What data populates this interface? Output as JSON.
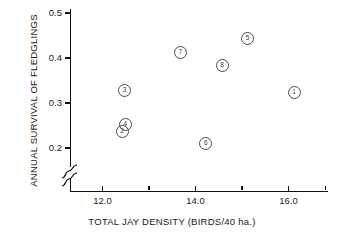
{
  "chart_data": {
    "type": "scatter",
    "title": "",
    "xlabel": "TOTAL JAY DENSITY (BIRDS/40 ha.)",
    "ylabel": "ANNUAL SURVIVAL OF FLEDGLINGS",
    "xlim": [
      11.3,
      16.85
    ],
    "ylim": [
      0.185,
      0.515
    ],
    "grid": false,
    "legend": "none",
    "axis_break": {
      "axis": "y",
      "below": 0.2,
      "style": "squiggle"
    },
    "xticks": [
      {
        "value": 12.0,
        "label": "12.0",
        "major": true
      },
      {
        "value": 13.0,
        "label": "",
        "major": false
      },
      {
        "value": 14.0,
        "label": "14.0",
        "major": true
      },
      {
        "value": 15.0,
        "label": "",
        "major": false
      },
      {
        "value": 16.0,
        "label": "16.0",
        "major": true
      },
      {
        "value": 16.8,
        "label": "",
        "major": false
      }
    ],
    "yticks": [
      {
        "value": 0.2,
        "label": "0.2"
      },
      {
        "value": 0.3,
        "label": "0.3"
      },
      {
        "value": 0.4,
        "label": "0.4"
      },
      {
        "value": 0.5,
        "label": "0.5"
      }
    ],
    "point_label_style": "circled-number",
    "points": [
      {
        "label": "1",
        "glyph": "①",
        "x": 16.1,
        "y": 0.325
      },
      {
        "label": "2",
        "glyph": "②",
        "x": 12.4,
        "y": 0.238
      },
      {
        "label": "3",
        "glyph": "③",
        "x": 12.45,
        "y": 0.33
      },
      {
        "label": "4",
        "glyph": "④",
        "x": 12.47,
        "y": 0.255
      },
      {
        "label": "5",
        "glyph": "⑤",
        "x": 15.1,
        "y": 0.445
      },
      {
        "label": "6",
        "glyph": "⑥",
        "x": 14.2,
        "y": 0.213
      },
      {
        "label": "7",
        "glyph": "⑦",
        "x": 13.65,
        "y": 0.415
      },
      {
        "label": "8",
        "glyph": "⑧",
        "x": 14.55,
        "y": 0.385
      }
    ]
  }
}
